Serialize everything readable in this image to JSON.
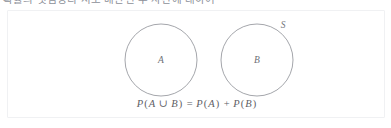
{
  "page": {
    "background_color": "#ffffff",
    "width": 391,
    "height": 128
  },
  "top_strip": {
    "clipped_heading": "확률의 덧셈정리 서로 배반인 두 사건에 대하여"
  },
  "panel": {
    "border_color": "#f0f1f3",
    "background_color": "#ffffff"
  },
  "figure": {
    "type": "venn-diagram",
    "stroke_color": "#9a9ca2",
    "universe_label": "S",
    "circles": [
      {
        "label": "A",
        "cx": 153,
        "cy": 49,
        "r": 36
      },
      {
        "label": "B",
        "cx": 249,
        "cy": 49,
        "r": 36
      }
    ],
    "labels": {
      "set_a": "A",
      "set_b": "B",
      "universe": "S"
    }
  },
  "caption": {
    "formula_parts": {
      "p1": "P",
      "open1": "(",
      "a1": "A",
      "union": " ∪ ",
      "b1": "B",
      "close1": ")",
      "equals": " = ",
      "p2": "P",
      "open2": "(",
      "a2": "A",
      "close2": ")",
      "plus": " + ",
      "p3": "P",
      "open3": "(",
      "b2": "B",
      "close3": ")"
    },
    "formula_text": "P(A ∪ B) = P(A) + P(B)"
  }
}
